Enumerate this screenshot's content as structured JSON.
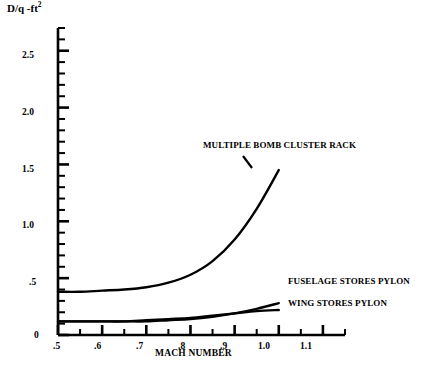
{
  "chart_data": {
    "type": "line",
    "title": "",
    "xlabel": "MACH NUMBER",
    "ylabel": "D/q -ft",
    "ylabel_exponent": "2",
    "xlim": [
      0.5,
      1.15
    ],
    "ylim": [
      0.0,
      2.7
    ],
    "grid": false,
    "legend_position": "inline-annotations",
    "x_ticks_major": [
      ".5",
      ".6",
      ".7",
      ".8",
      ".9",
      "1.0",
      "1.1"
    ],
    "x_ticks_major_values": [
      0.5,
      0.6,
      0.7,
      0.8,
      0.9,
      1.0,
      1.1
    ],
    "x_minor_step": 0.05,
    "y_ticks_major": [
      "0",
      ".5",
      "1.0",
      "1.5",
      "2.0",
      "2.5"
    ],
    "y_ticks_major_values": [
      0.0,
      0.5,
      1.0,
      1.5,
      2.0,
      2.5
    ],
    "y_minor_step": 0.1,
    "series": [
      {
        "name": "MULTIPLE BOMB CLUSTER RACK",
        "x": [
          0.5,
          0.55,
          0.6,
          0.65,
          0.7,
          0.75,
          0.8,
          0.85,
          0.9,
          0.95,
          1.0
        ],
        "values": [
          0.38,
          0.38,
          0.39,
          0.4,
          0.42,
          0.46,
          0.53,
          0.65,
          0.84,
          1.11,
          1.45
        ]
      },
      {
        "name": "FUSELAGE STORES PYLON",
        "x": [
          0.5,
          0.55,
          0.6,
          0.65,
          0.7,
          0.75,
          0.8,
          0.85,
          0.9,
          0.95,
          1.0
        ],
        "values": [
          0.12,
          0.12,
          0.12,
          0.12,
          0.12,
          0.13,
          0.14,
          0.16,
          0.19,
          0.23,
          0.28
        ]
      },
      {
        "name": "WING STORES PYLON",
        "x": [
          0.5,
          0.55,
          0.6,
          0.65,
          0.7,
          0.75,
          0.8,
          0.85,
          0.9,
          0.95,
          1.0
        ],
        "values": [
          0.12,
          0.12,
          0.12,
          0.12,
          0.13,
          0.14,
          0.15,
          0.17,
          0.19,
          0.21,
          0.22
        ]
      }
    ],
    "annotations": [
      {
        "text": "MULTIPLE BOMB CLUSTER RACK"
      },
      {
        "text": "FUSELAGE STORES PYLON"
      },
      {
        "text": "WING STORES PYLON"
      }
    ],
    "colors": {
      "line": "#000000",
      "axis": "#000000",
      "background": "#ffffff",
      "text": "#000000"
    }
  }
}
